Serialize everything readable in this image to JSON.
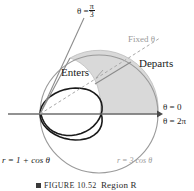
{
  "figure": {
    "kind": "polar-curve-diagram",
    "background": "#ffffff",
    "colors": {
      "cardioid_stroke": "#1a1a1a",
      "circle_stroke": "#9a9a9a",
      "shaded_region_fill": "#d9d9d9",
      "shaded_region_stroke": "#b5b5b5",
      "axis": "#6e6e6e",
      "ray_solid": "#8c8c8c",
      "ray_dashed": "#a8a8a8",
      "label_dark": "#1a1a1a",
      "label_gray": "#9a9a9a"
    },
    "geometry": {
      "origin": {
        "x": 40,
        "y": 114
      },
      "axis_start_x": 8,
      "axis_end_x": 162,
      "cardioid": {
        "a": 1,
        "equation": "r = 1 + cos θ",
        "scale_px": 58
      },
      "circle": {
        "equation": "r = 3 cos θ",
        "diameter_px": 118,
        "center": {
          "x": 99,
          "y": 114
        }
      },
      "intersection_point": {
        "x": 70,
        "y": 58
      },
      "fixed_theta_deg": 26,
      "theta_pi3_deg": 60
    }
  },
  "labels": {
    "theta_pi3": {
      "lead": "θ =",
      "numerator": "π",
      "denominator": "3"
    },
    "fixed_theta": "Fixed θ",
    "departs": "Departs",
    "enters": "Enters",
    "theta_zero": "θ = 0",
    "theta_two_pi": "θ = 2π",
    "cardioid_equation": "r = 1 + cos θ",
    "circle_equation": "r = 3 cos θ"
  },
  "caption": {
    "figure_number": "FIGURE 10.52",
    "region_text": "Region R"
  }
}
